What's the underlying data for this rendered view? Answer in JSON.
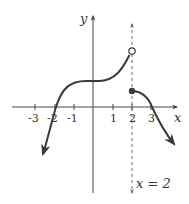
{
  "figure": {
    "type": "function graph with jump discontinuity",
    "axes": {
      "x_label": "x",
      "y_label": "y",
      "x_ticks": [
        "-3",
        "-2",
        "-1",
        "1",
        "2",
        "3"
      ]
    },
    "asymptote_label": "x = 2",
    "points": {
      "open_circle": {
        "x": 2,
        "y": 3
      },
      "filled_dot": {
        "x": 2,
        "y": 1
      }
    },
    "colors": {
      "curve": "#3a3a3a",
      "axis": "#444444",
      "dashed_line": "#666666"
    }
  }
}
